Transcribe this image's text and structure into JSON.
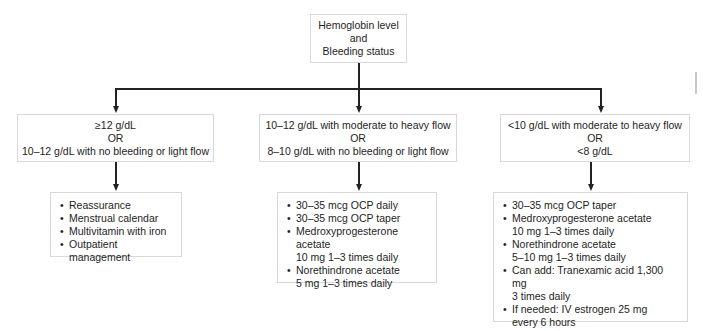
{
  "root": {
    "lines": [
      "Hemoglobin level",
      "and",
      "Bleeding status"
    ]
  },
  "branches": [
    {
      "criteria": [
        "≥12 g/dL",
        "OR",
        "10–12 g/dL with no bleeding or light flow"
      ],
      "treatment": [
        {
          "main": "Reassurance"
        },
        {
          "main": "Menstrual calendar"
        },
        {
          "main": "Multivitamin with iron"
        },
        {
          "main": "Outpatient management"
        }
      ]
    },
    {
      "criteria": [
        "10–12 g/dL with moderate to heavy flow",
        "OR",
        "8–10 g/dL with no bleeding or light flow"
      ],
      "treatment": [
        {
          "main": "30–35 mcg OCP daily"
        },
        {
          "main": "30–35 mcg OCP taper"
        },
        {
          "main": "Medroxyprogesterone acetate",
          "sub": "10 mg 1–3 times daily"
        },
        {
          "main": "Norethindrone acetate",
          "sub": "5 mg 1–3 times daily"
        }
      ]
    },
    {
      "criteria": [
        "<10 g/dL with moderate to heavy flow",
        "OR",
        "<8 g/dL"
      ],
      "treatment": [
        {
          "main": "30–35 mcg OCP taper"
        },
        {
          "main": "Medroxyprogesterone acetate",
          "sub": "10 mg 1–3 times daily"
        },
        {
          "main": "Norethindrone acetate",
          "sub": "5–10 mg 1–3 times daily"
        },
        {
          "main": "Can add: Tranexamic acid 1,300 mg",
          "sub": "3 times daily"
        },
        {
          "main": "If needed: IV estrogen 25 mg",
          "sub": "every 6 hours"
        }
      ]
    }
  ],
  "colors": {
    "line": "#222222",
    "box_border": "#d8d8d8",
    "text": "#1e1e1e"
  }
}
